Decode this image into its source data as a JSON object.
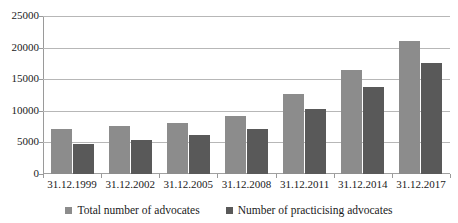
{
  "chart_data": {
    "type": "bar",
    "title": "",
    "subtitle": "",
    "xlabel": "",
    "ylabel": "",
    "ylim": [
      0,
      25000
    ],
    "ytick_step": 5000,
    "yticks": [
      "0",
      "5000",
      "10000",
      "15000",
      "20000",
      "25000"
    ],
    "grid": true,
    "legend_position": "bottom",
    "categories": [
      "31.12.1999",
      "31.12.2002",
      "31.12.2005",
      "31.12.2008",
      "31.12.2011",
      "31.12.2014",
      "31.12.2017"
    ],
    "series": [
      {
        "name": "Total number of advocates",
        "color": "#8c8c8c",
        "values": [
          7100,
          7600,
          8100,
          9200,
          12600,
          16500,
          21000
        ]
      },
      {
        "name": "Number of practicising advocates",
        "color": "#595959",
        "values": [
          4800,
          5400,
          6100,
          7200,
          10300,
          13800,
          17500
        ]
      }
    ]
  },
  "legend": {
    "items": [
      {
        "label": "Total number of advocates",
        "marker": "square-marker"
      },
      {
        "label": "Number of practicising advocates",
        "marker": "square-marker"
      }
    ]
  },
  "colors": {
    "series_total": "#8c8c8c",
    "series_practicing": "#595959",
    "gridline": "#b7b7b7",
    "axis": "#9a9a9a",
    "text": "#1a1a1a",
    "background": "#ffffff"
  }
}
